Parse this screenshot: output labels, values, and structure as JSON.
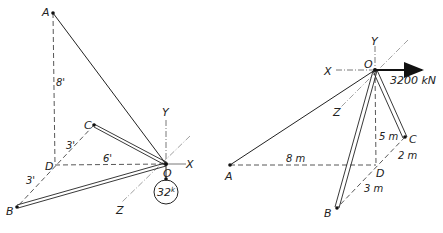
{
  "figures": [
    {
      "id": "left",
      "points": {
        "A": "A",
        "B": "B",
        "C": "C",
        "D": "D",
        "O": "O"
      },
      "axes": {
        "x": "X",
        "y": "Y",
        "z": "Z"
      },
      "dimensions": {
        "AD": "8'",
        "DC": "3'",
        "DO": "6'",
        "DB": "3'"
      },
      "load": {
        "label": "32",
        "unit_sup": "k"
      }
    },
    {
      "id": "right",
      "points": {
        "A": "A",
        "B": "B",
        "C": "C",
        "D": "D",
        "O": "O"
      },
      "axes": {
        "x": "X",
        "y": "Y",
        "z": "Z"
      },
      "dimensions": {
        "AD": "8 m",
        "OD": "5 m",
        "DC": "2 m",
        "DB": "3 m"
      },
      "force": {
        "label": "3200 kN"
      }
    }
  ]
}
